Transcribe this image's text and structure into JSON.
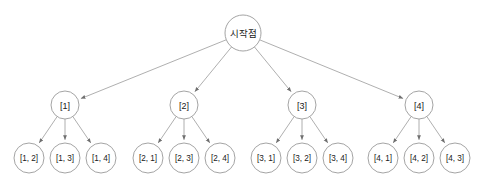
{
  "figure": {
    "name": "permutation-tree",
    "background_color": "#ffffff",
    "stroke_color": "#9a9a9a",
    "text_color": "#1a1a1a"
  },
  "root": {
    "id": "root",
    "label": "시작점",
    "cx": 243,
    "cy": 33,
    "r": 18
  },
  "levels": [
    {
      "name": "level-1-branches",
      "r": 14,
      "cy": 105,
      "nodes": [
        {
          "id": "n1",
          "label": "[1]",
          "cx": 65
        },
        {
          "id": "n2",
          "label": "[2]",
          "cx": 184
        },
        {
          "id": "n3",
          "label": "[3]",
          "cx": 302
        },
        {
          "id": "n4",
          "label": "[4]",
          "cx": 419
        }
      ]
    },
    {
      "name": "level-2-leaves",
      "r": 15,
      "cy": 158,
      "nodes": [
        {
          "id": "n1a",
          "parent": "n1",
          "label": "[1, 2]",
          "cx": 29
        },
        {
          "id": "n1b",
          "parent": "n1",
          "label": "[1, 3]",
          "cx": 65
        },
        {
          "id": "n1c",
          "parent": "n1",
          "label": "[1, 4]",
          "cx": 101
        },
        {
          "id": "n2a",
          "parent": "n2",
          "label": "[2, 1]",
          "cx": 148
        },
        {
          "id": "n2b",
          "parent": "n2",
          "label": "[2, 3]",
          "cx": 184
        },
        {
          "id": "n2c",
          "parent": "n2",
          "label": "[2, 4]",
          "cx": 220
        },
        {
          "id": "n3a",
          "parent": "n3",
          "label": "[3, 1]",
          "cx": 266
        },
        {
          "id": "n3b",
          "parent": "n3",
          "label": "[3, 2]",
          "cx": 302
        },
        {
          "id": "n3c",
          "parent": "n3",
          "label": "[3, 4]",
          "cx": 338
        },
        {
          "id": "n4a",
          "parent": "n4",
          "label": "[4, 1]",
          "cx": 383
        },
        {
          "id": "n4b",
          "parent": "n4",
          "label": "[4, 2]",
          "cx": 419
        },
        {
          "id": "n4c",
          "parent": "n4",
          "label": "[4, 3]",
          "cx": 455
        }
      ]
    }
  ],
  "edges": [
    {
      "from": "root",
      "to": "n1"
    },
    {
      "from": "root",
      "to": "n2"
    },
    {
      "from": "root",
      "to": "n3"
    },
    {
      "from": "root",
      "to": "n4"
    },
    {
      "from": "n1",
      "to": "n1a"
    },
    {
      "from": "n1",
      "to": "n1b"
    },
    {
      "from": "n1",
      "to": "n1c"
    },
    {
      "from": "n2",
      "to": "n2a"
    },
    {
      "from": "n2",
      "to": "n2b"
    },
    {
      "from": "n2",
      "to": "n2c"
    },
    {
      "from": "n3",
      "to": "n3a"
    },
    {
      "from": "n3",
      "to": "n3b"
    },
    {
      "from": "n3",
      "to": "n3c"
    },
    {
      "from": "n4",
      "to": "n4a"
    },
    {
      "from": "n4",
      "to": "n4b"
    },
    {
      "from": "n4",
      "to": "n4c"
    }
  ]
}
